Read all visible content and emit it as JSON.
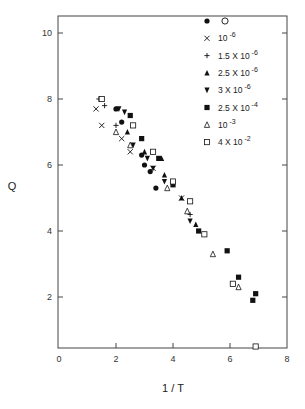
{
  "chart_data": {
    "type": "scatter",
    "title": "",
    "xlabel": "1 / T",
    "ylabel": "Q",
    "xlim": [
      0,
      8
    ],
    "ylim": [
      0.45,
      10.5
    ],
    "xticks": [
      "0",
      "2",
      "4",
      "6",
      "8"
    ],
    "yticks": [
      "2",
      "4",
      "6",
      "8",
      "10"
    ],
    "grid": false,
    "legend_position": "upper right (inside)",
    "series": [
      {
        "name": "O",
        "marker": "filled-circle",
        "points": [
          [
            2.0,
            7.7
          ],
          [
            2.9,
            6.3
          ],
          [
            3.0,
            6.0
          ],
          [
            3.2,
            5.8
          ],
          [
            3.4,
            5.3
          ],
          [
            2.2,
            7.3
          ]
        ]
      },
      {
        "name": "10^-6",
        "marker": "x",
        "points": [
          [
            1.3,
            7.7
          ],
          [
            1.5,
            7.2
          ],
          [
            2.2,
            6.8
          ],
          [
            2.5,
            6.4
          ],
          [
            3.3,
            5.9
          ],
          [
            4.3,
            5.0
          ]
        ]
      },
      {
        "name": "1.5 X 10^-6",
        "marker": "plus",
        "points": [
          [
            1.4,
            8.0
          ],
          [
            1.6,
            7.8
          ],
          [
            2.0,
            7.2
          ],
          [
            4.6,
            4.5
          ]
        ]
      },
      {
        "name": "2.5 X 10^-6",
        "marker": "filled-triangle-up",
        "points": [
          [
            2.4,
            7.0
          ],
          [
            3.0,
            6.4
          ],
          [
            3.6,
            6.2
          ],
          [
            3.7,
            5.7
          ],
          [
            4.3,
            5.0
          ],
          [
            4.8,
            4.2
          ]
        ]
      },
      {
        "name": "3 X 10^-6",
        "marker": "filled-triangle-down",
        "points": [
          [
            2.1,
            7.7
          ],
          [
            2.3,
            7.6
          ],
          [
            2.6,
            6.6
          ],
          [
            3.1,
            6.2
          ],
          [
            3.3,
            5.9
          ],
          [
            3.7,
            5.5
          ],
          [
            4.6,
            4.3
          ]
        ]
      },
      {
        "name": "2.5 X 10^-4",
        "marker": "filled-square",
        "points": [
          [
            2.5,
            7.5
          ],
          [
            2.9,
            6.8
          ],
          [
            3.5,
            6.2
          ],
          [
            4.0,
            5.4
          ],
          [
            4.9,
            4.0
          ],
          [
            5.9,
            3.4
          ],
          [
            6.3,
            2.6
          ],
          [
            6.9,
            2.1
          ],
          [
            6.8,
            1.9
          ]
        ]
      },
      {
        "name": "10^-3",
        "marker": "open-triangle-up",
        "points": [
          [
            2.0,
            7.0
          ],
          [
            2.5,
            6.6
          ],
          [
            3.8,
            5.3
          ],
          [
            4.5,
            4.6
          ],
          [
            5.4,
            3.3
          ],
          [
            6.3,
            2.3
          ]
        ]
      },
      {
        "name": "4 X 10^-2",
        "marker": "open-square",
        "points": [
          [
            1.5,
            8.0
          ],
          [
            2.6,
            7.2
          ],
          [
            3.3,
            6.4
          ],
          [
            4.0,
            5.5
          ],
          [
            4.6,
            4.9
          ],
          [
            5.1,
            3.9
          ],
          [
            6.1,
            2.4
          ],
          [
            6.9,
            0.5
          ]
        ]
      }
    ]
  },
  "legend": [
    {
      "marker": "filled-circle",
      "label": "O"
    },
    {
      "marker": "x",
      "label": "10",
      "exp": "-6"
    },
    {
      "marker": "plus",
      "label": "1.5 X 10",
      "exp": "-6"
    },
    {
      "marker": "filled-triangle-up",
      "label": "2.5 X 10",
      "exp": "-6"
    },
    {
      "marker": "filled-triangle-down",
      "label": "3 X 10",
      "exp": "-6"
    },
    {
      "marker": "filled-square",
      "label": "2.5 X 10",
      "exp": "-4"
    },
    {
      "marker": "open-triangle-up",
      "label": "10",
      "exp": "-3"
    },
    {
      "marker": "open-square",
      "label": "4 X 10",
      "exp": "-2"
    }
  ]
}
